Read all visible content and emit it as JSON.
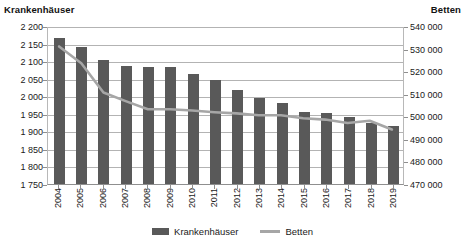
{
  "axes": {
    "left_title": "Krankenhäuser",
    "right_title": "Betten"
  },
  "legend": {
    "items": [
      {
        "label": "Krankenhäuser",
        "marker": "bar-swatch-icon",
        "color": "#595959"
      },
      {
        "label": "Betten",
        "marker": "line-swatch-icon",
        "color": "#A6A6A6"
      }
    ]
  },
  "chart_data": {
    "type": "bar",
    "title": "",
    "xlabel": "",
    "ylabel": "Krankenhäuser",
    "y2label": "Betten",
    "grid": true,
    "legend_position": "bottom",
    "categories": [
      "2004",
      "2005",
      "2006",
      "2007",
      "2008",
      "2009",
      "2010",
      "2011",
      "2012",
      "2013",
      "2014",
      "2015",
      "2016",
      "2017",
      "2018",
      "2019"
    ],
    "ylim": [
      1750,
      2200
    ],
    "yticks": [
      "1 750",
      "1 800",
      "1 850",
      "1 900",
      "1 950",
      "2 000",
      "2 050",
      "2 100",
      "2 150",
      "2 200"
    ],
    "ytick_values": [
      1750,
      1800,
      1850,
      1900,
      1950,
      2000,
      2050,
      2100,
      2150,
      2200
    ],
    "y2lim": [
      470000,
      540000
    ],
    "y2ticks": [
      "470 000",
      "480 000",
      "490 000",
      "500 000",
      "510 000",
      "520 000",
      "530 000",
      "540 000"
    ],
    "y2tick_values": [
      470000,
      480000,
      490000,
      500000,
      510000,
      520000,
      530000,
      540000
    ],
    "series": [
      {
        "name": "Krankenhäuser",
        "type": "bar",
        "axis": "left",
        "color": "#595959",
        "values": [
          2166,
          2139,
          2104,
          2087,
          2083,
          2084,
          2064,
          2045,
          2017,
          1996,
          1980,
          1956,
          1951,
          1942,
          1925,
          1914
        ]
      },
      {
        "name": "Betten",
        "type": "line",
        "axis": "right",
        "color": "#A6A6A6",
        "values": [
          531333,
          523824,
          510767,
          506954,
          503360,
          503341,
          502749,
          502029,
          501475,
          500671,
          500680,
          499351,
          498718,
          497200,
          498192,
          494326
        ]
      }
    ]
  }
}
